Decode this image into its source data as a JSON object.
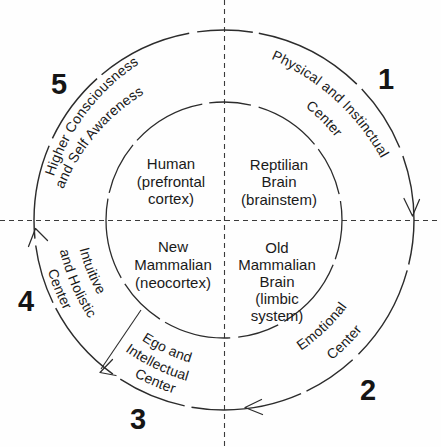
{
  "colors": {
    "background": "#fefefe",
    "ink": "#2c2c2c",
    "text": "#1a1a1a"
  },
  "ring": {
    "physical": {
      "line1": "Physical and Instinctual",
      "line2": "Center",
      "number": "1"
    },
    "emotional": {
      "line1": "Emotional",
      "line2": "Center",
      "number": "2"
    },
    "ego": {
      "line1": "Ego and",
      "line2": "Intellectual",
      "line3": "Center",
      "number": "3"
    },
    "intuitive": {
      "line1": "Intuitive",
      "line2": "and Holistic",
      "line3": "Center",
      "number": "4"
    },
    "higher": {
      "line1": "Higher Consciousness",
      "line2": "and Self Awareness",
      "number": "5"
    }
  },
  "quadrants": {
    "human": {
      "line1": "Human",
      "line2": "(prefrontal",
      "line3": "cortex)"
    },
    "reptilian": {
      "line1": "Reptilian",
      "line2": "Brain",
      "line3": "(brainstem)"
    },
    "new_mammalian": {
      "line1": "New",
      "line2": "Mammalian",
      "line3": "(neocortex)"
    },
    "old_mammalian": {
      "line1": "Old",
      "line2": "Mammalian",
      "line3": "Brain",
      "line4": "(limbic",
      "line5": "system)"
    }
  }
}
